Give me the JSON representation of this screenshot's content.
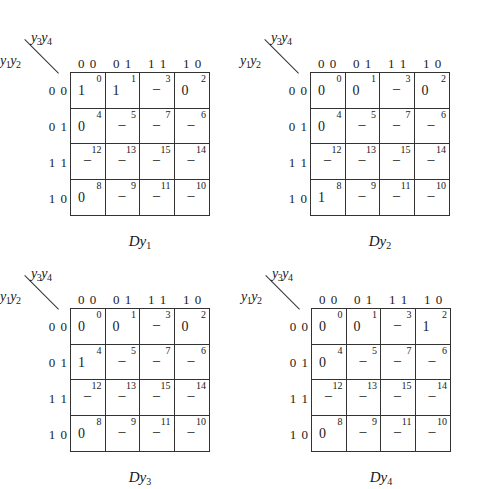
{
  "maps": [
    {
      "title": "Dy",
      "title_sub": "1",
      "row_var": "y",
      "row_var_sub": [
        "1",
        "2"
      ],
      "col_var": "y",
      "col_var_sub": [
        "3",
        "4"
      ],
      "col_headers": [
        "0 0",
        "0 1",
        "1 1",
        "1 0"
      ],
      "row_headers": [
        "0 0",
        "0 1",
        "1 1",
        "1 0"
      ],
      "cells": [
        [
          {
            "idx": "0",
            "val": "1"
          },
          {
            "idx": "1",
            "val": "1"
          },
          {
            "idx": "3",
            "val": "–"
          },
          {
            "idx": "2",
            "val": "0"
          }
        ],
        [
          {
            "idx": "4",
            "val": "0"
          },
          {
            "idx": "5",
            "val": "–"
          },
          {
            "idx": "7",
            "val": "–"
          },
          {
            "idx": "6",
            "val": "–"
          }
        ],
        [
          {
            "idx": "12",
            "val": "–"
          },
          {
            "idx": "13",
            "val": "–"
          },
          {
            "idx": "15",
            "val": "–"
          },
          {
            "idx": "14",
            "val": "–"
          }
        ],
        [
          {
            "idx": "8",
            "val": "0"
          },
          {
            "idx": "9",
            "val": "–"
          },
          {
            "idx": "11",
            "val": "–"
          },
          {
            "idx": "10",
            "val": "–"
          }
        ]
      ]
    },
    {
      "title": "Dy",
      "title_sub": "2",
      "row_var": "y",
      "row_var_sub": [
        "1",
        "2"
      ],
      "col_var": "y",
      "col_var_sub": [
        "3",
        "4"
      ],
      "col_headers": [
        "0 0",
        "0 1",
        "1 1",
        "1 0"
      ],
      "row_headers": [
        "0 0",
        "0 1",
        "1 1",
        "1 0"
      ],
      "cells": [
        [
          {
            "idx": "0",
            "val": "0"
          },
          {
            "idx": "1",
            "val": "0"
          },
          {
            "idx": "3",
            "val": "–"
          },
          {
            "idx": "2",
            "val": "0"
          }
        ],
        [
          {
            "idx": "4",
            "val": "0"
          },
          {
            "idx": "5",
            "val": "–"
          },
          {
            "idx": "7",
            "val": "–"
          },
          {
            "idx": "6",
            "val": "–"
          }
        ],
        [
          {
            "idx": "12",
            "val": "–"
          },
          {
            "idx": "13",
            "val": "–"
          },
          {
            "idx": "15",
            "val": "–"
          },
          {
            "idx": "14",
            "val": "–"
          }
        ],
        [
          {
            "idx": "8",
            "val": "1"
          },
          {
            "idx": "9",
            "val": "–"
          },
          {
            "idx": "11",
            "val": "–"
          },
          {
            "idx": "10",
            "val": "–"
          }
        ]
      ]
    },
    {
      "title": "Dy",
      "title_sub": "3",
      "row_var": "y",
      "row_var_sub": [
        "1",
        "2"
      ],
      "col_var": "y",
      "col_var_sub": [
        "3",
        "4"
      ],
      "col_headers": [
        "0 0",
        "0 1",
        "1 1",
        "1 0"
      ],
      "row_headers": [
        "0 0",
        "0 1",
        "1 1",
        "1 0"
      ],
      "cells": [
        [
          {
            "idx": "0",
            "val": "0"
          },
          {
            "idx": "1",
            "val": "0"
          },
          {
            "idx": "3",
            "val": "–"
          },
          {
            "idx": "2",
            "val": "0"
          }
        ],
        [
          {
            "idx": "4",
            "val": "1"
          },
          {
            "idx": "5",
            "val": "–"
          },
          {
            "idx": "7",
            "val": "–"
          },
          {
            "idx": "6",
            "val": "–"
          }
        ],
        [
          {
            "idx": "12",
            "val": "–"
          },
          {
            "idx": "13",
            "val": "–"
          },
          {
            "idx": "15",
            "val": "–"
          },
          {
            "idx": "14",
            "val": "–"
          }
        ],
        [
          {
            "idx": "8",
            "val": "0"
          },
          {
            "idx": "9",
            "val": "–"
          },
          {
            "idx": "11",
            "val": "–"
          },
          {
            "idx": "10",
            "val": "–"
          }
        ]
      ]
    },
    {
      "title": "Dy",
      "title_sub": "4",
      "row_var": "y",
      "row_var_sub": [
        "1",
        "2"
      ],
      "col_var": "y",
      "col_var_sub": [
        "3",
        "4"
      ],
      "col_headers": [
        "0 0",
        "0 1",
        "1 1",
        "1 0"
      ],
      "row_headers": [
        "0 0",
        "0 1",
        "1 1",
        "1 0"
      ],
      "cells": [
        [
          {
            "idx": "0",
            "val": "0"
          },
          {
            "idx": "1",
            "val": "0"
          },
          {
            "idx": "3",
            "val": "–"
          },
          {
            "idx": "2",
            "val": "1"
          }
        ],
        [
          {
            "idx": "4",
            "val": "0"
          },
          {
            "idx": "5",
            "val": "–"
          },
          {
            "idx": "7",
            "val": "–"
          },
          {
            "idx": "6",
            "val": "–"
          }
        ],
        [
          {
            "idx": "12",
            "val": "–"
          },
          {
            "idx": "13",
            "val": "–"
          },
          {
            "idx": "15",
            "val": "–"
          },
          {
            "idx": "14",
            "val": "–"
          }
        ],
        [
          {
            "idx": "8",
            "val": "0"
          },
          {
            "idx": "9",
            "val": "–"
          },
          {
            "idx": "11",
            "val": "–"
          },
          {
            "idx": "10",
            "val": "–"
          }
        ]
      ]
    }
  ]
}
